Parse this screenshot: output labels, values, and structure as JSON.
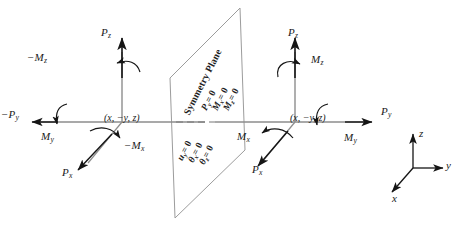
{
  "figure": {
    "background_color": "#ffffff",
    "line_color": "#808080",
    "text_color": "#1a1a1a",
    "plane_edge_color": "#9a9a9a"
  },
  "symmetry_plane": {
    "title": "Symmetry Plane",
    "conditions_upper": [
      {
        "symbol": "P",
        "subscript": "y",
        "text": "P",
        "sub": "y",
        "value": "0",
        "full": "Py = 0"
      },
      {
        "symbol": "M",
        "subscript": "x",
        "text": "M",
        "sub": "x",
        "value": "0",
        "full": "Mx = 0"
      },
      {
        "symbol": "M",
        "subscript": "z",
        "text": "M",
        "sub": "z",
        "value": "0",
        "full": "Mz = 0"
      }
    ],
    "conditions_lower": [
      {
        "symbol": "u",
        "subscript": "y",
        "text": "u",
        "sub": "y",
        "value": "0",
        "full": "uy = 0"
      },
      {
        "symbol": "θ",
        "subscript": "x",
        "text": "θ",
        "sub": "x",
        "value": "0",
        "full": "θx = 0"
      },
      {
        "symbol": "θ",
        "subscript": "z",
        "text": "θ",
        "sub": "z",
        "value": "0",
        "full": "θz = 0"
      }
    ],
    "equals_zero": "= 0"
  },
  "left_node": {
    "coordinate_label_prefix": "(",
    "coordinate_label": "(x, −y, z)",
    "coord_x": "x",
    "coord_y": "−y",
    "coord_z": "z",
    "vectors": [
      {
        "name": "force-z",
        "text": "P",
        "sub": "z",
        "sign": "",
        "label": "Pz"
      },
      {
        "name": "moment-z",
        "text": "M",
        "sub": "z",
        "sign": "−",
        "label": "−Mz"
      },
      {
        "name": "force-y",
        "text": "P",
        "sub": "y",
        "sign": "−",
        "label": "−Py"
      },
      {
        "name": "moment-y",
        "text": "M",
        "sub": "y",
        "sign": "",
        "label": "My"
      },
      {
        "name": "force-x",
        "text": "P",
        "sub": "x",
        "sign": "",
        "label": "Px"
      },
      {
        "name": "moment-x",
        "text": "M",
        "sub": "x",
        "sign": "−",
        "label": "−Mx"
      }
    ]
  },
  "right_node": {
    "coordinate_label": "(x, −y, z)",
    "coord_x": "x",
    "coord_y": "−y",
    "coord_z": "z",
    "vectors": [
      {
        "name": "force-z",
        "text": "P",
        "sub": "z",
        "sign": "",
        "label": "Pz"
      },
      {
        "name": "moment-z",
        "text": "M",
        "sub": "z",
        "sign": "",
        "label": "Mz"
      },
      {
        "name": "force-y",
        "text": "P",
        "sub": "y",
        "sign": "",
        "label": "Py"
      },
      {
        "name": "moment-y",
        "text": "M",
        "sub": "y",
        "sign": "",
        "label": "My"
      },
      {
        "name": "force-x",
        "text": "P",
        "sub": "x",
        "sign": "",
        "label": "Px"
      },
      {
        "name": "moment-x",
        "text": "M",
        "sub": "x",
        "sign": "",
        "label": "Mx"
      }
    ]
  },
  "axis_triad": {
    "x_label": "x",
    "y_label": "y",
    "z_label": "z"
  }
}
